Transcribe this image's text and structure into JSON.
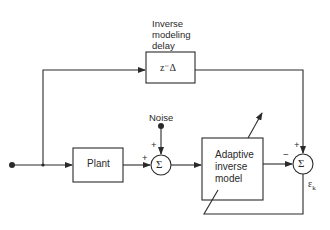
{
  "diagram": {
    "delay_label": [
      "Inverse",
      "modeling",
      "delay"
    ],
    "delay_block": "z⁻Δ",
    "plant_block": "Plant",
    "noise_label": "Noise",
    "adaptive_block": [
      "Adaptive",
      "inverse",
      "model"
    ],
    "sum_symbol": "Σ",
    "sum1_signs": {
      "left": "+",
      "top": "+"
    },
    "sum2_signs": {
      "left": "−",
      "top": "+"
    },
    "error_label": "ε",
    "error_subscript": "k",
    "colors": {
      "line": "#2a2a2a",
      "background": "#ffffff"
    }
  }
}
